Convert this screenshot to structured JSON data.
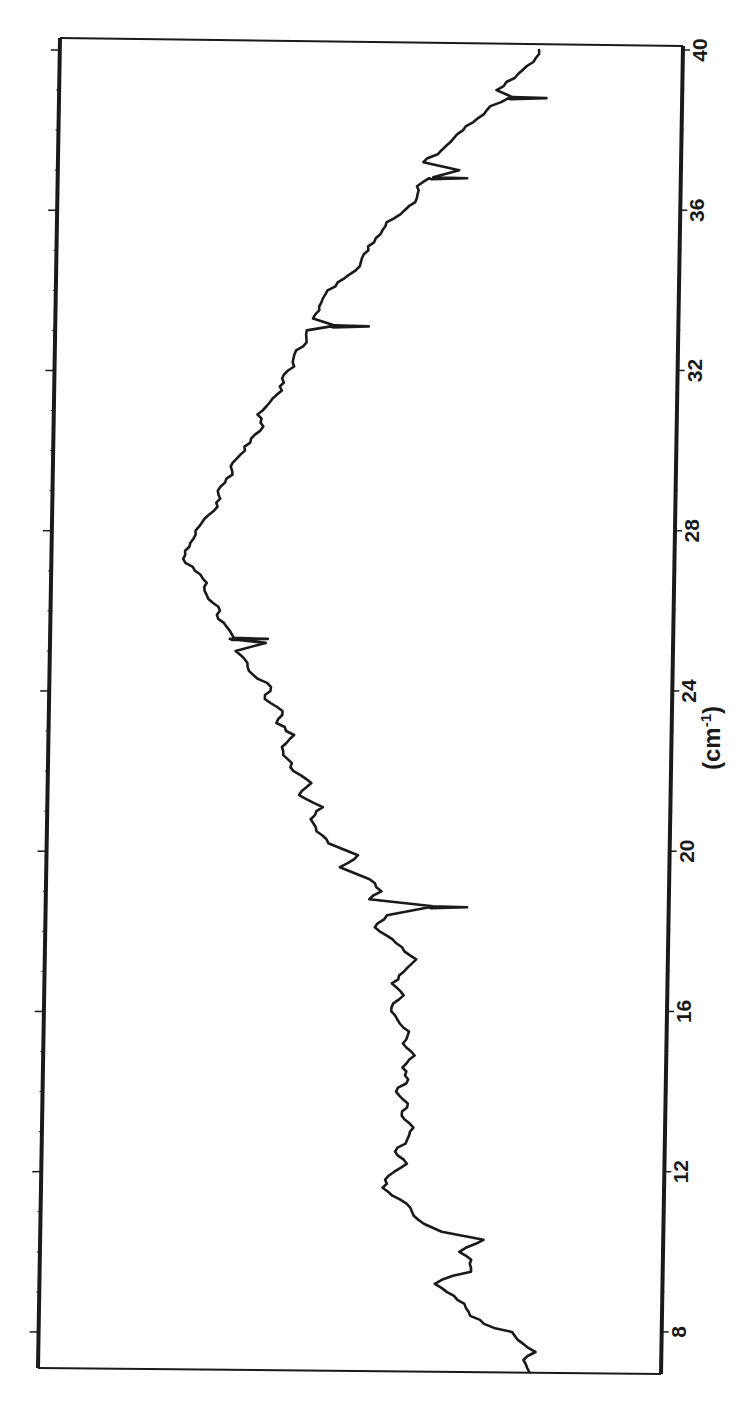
{
  "chart_data": {
    "type": "line",
    "orientation": "rotated-90-clockwise",
    "title": "",
    "xlabel": "(cm-1)",
    "xlabel_main": "(cm",
    "xlabel_sup": "-1",
    "xlabel_close": ")",
    "ylabel": "",
    "xlim": [
      7,
      40
    ],
    "ylim": [
      0,
      1
    ],
    "x_ticks": [
      8,
      12,
      16,
      20,
      24,
      28,
      32,
      36,
      40
    ],
    "x_tick_labels": [
      "8",
      "12",
      "16",
      "20",
      "24",
      "28",
      "32",
      "36",
      "40"
    ],
    "y_ticks_unlabeled": true,
    "grid": false,
    "legend": null,
    "series": [
      {
        "name": "spectrum",
        "color": "#1a1a1a",
        "x": [
          7.0,
          7.3,
          7.5,
          7.8,
          8.0,
          8.1,
          8.4,
          8.7,
          9.0,
          9.2,
          9.4,
          9.5,
          9.8,
          10.0,
          10.3,
          10.5,
          10.7,
          11.0,
          11.3,
          11.6,
          11.9,
          12.2,
          12.5,
          12.8,
          13.1,
          13.4,
          13.7,
          14.0,
          14.3,
          14.6,
          14.9,
          15.2,
          15.5,
          15.8,
          16.1,
          16.4,
          16.7,
          17.0,
          17.3,
          17.5,
          17.8,
          18.1,
          18.4,
          18.6,
          18.8,
          19.0,
          19.3,
          19.6,
          19.9,
          20.2,
          20.5,
          20.8,
          21.1,
          21.4,
          21.7,
          22.0,
          22.3,
          22.6,
          22.9,
          23.2,
          23.5,
          23.8,
          24.1,
          24.4,
          24.7,
          25.0,
          25.2,
          25.3,
          25.5,
          25.8,
          26.1,
          26.4,
          26.7,
          27.0,
          27.3,
          27.6,
          27.9,
          28.2,
          28.5,
          28.8,
          29.1,
          29.4,
          29.7,
          30.0,
          30.3,
          30.6,
          30.9,
          31.2,
          31.5,
          31.8,
          32.1,
          32.4,
          32.7,
          33.0,
          33.1,
          33.3,
          33.6,
          33.9,
          34.2,
          34.5,
          34.8,
          35.1,
          35.4,
          35.7,
          36.0,
          36.3,
          36.6,
          36.8,
          37.0,
          37.2,
          37.5,
          37.8,
          38.1,
          38.4,
          38.6,
          38.8,
          39.0,
          39.3,
          39.6,
          39.9,
          40.0
        ],
        "y": [
          0.2,
          0.21,
          0.19,
          0.22,
          0.23,
          0.26,
          0.3,
          0.31,
          0.34,
          0.36,
          0.33,
          0.3,
          0.3,
          0.32,
          0.28,
          0.35,
          0.38,
          0.4,
          0.42,
          0.45,
          0.44,
          0.41,
          0.43,
          0.41,
          0.4,
          0.42,
          0.41,
          0.43,
          0.41,
          0.42,
          0.4,
          0.42,
          0.41,
          0.43,
          0.44,
          0.42,
          0.44,
          0.42,
          0.4,
          0.42,
          0.44,
          0.47,
          0.45,
          0.38,
          0.48,
          0.46,
          0.48,
          0.53,
          0.5,
          0.55,
          0.57,
          0.58,
          0.56,
          0.6,
          0.58,
          0.61,
          0.62,
          0.63,
          0.61,
          0.64,
          0.63,
          0.66,
          0.65,
          0.68,
          0.69,
          0.71,
          0.66,
          0.72,
          0.72,
          0.74,
          0.74,
          0.76,
          0.76,
          0.78,
          0.8,
          0.79,
          0.78,
          0.77,
          0.75,
          0.74,
          0.74,
          0.72,
          0.72,
          0.7,
          0.69,
          0.67,
          0.68,
          0.66,
          0.64,
          0.64,
          0.62,
          0.62,
          0.6,
          0.6,
          0.56,
          0.59,
          0.58,
          0.57,
          0.55,
          0.52,
          0.51,
          0.5,
          0.48,
          0.47,
          0.44,
          0.42,
          0.42,
          0.4,
          0.35,
          0.41,
          0.38,
          0.36,
          0.34,
          0.31,
          0.3,
          0.27,
          0.29,
          0.26,
          0.24,
          0.22,
          0.22
        ]
      }
    ],
    "spikes": [
      {
        "x": 18.6,
        "direction": "down"
      },
      {
        "x": 25.3,
        "direction": "down"
      },
      {
        "x": 33.1,
        "direction": "down"
      },
      {
        "x": 36.8,
        "direction": "down"
      },
      {
        "x": 38.8,
        "direction": "down"
      }
    ],
    "peak": {
      "x": 27.4,
      "value": 0.8
    }
  },
  "frame": {
    "top_left": [
      60,
      38
    ],
    "top_right": [
      683,
      48
    ],
    "bottom_left": [
      38,
      1368
    ],
    "bottom_right": [
      661,
      1374
    ],
    "line_color": "#1a1a1a"
  }
}
